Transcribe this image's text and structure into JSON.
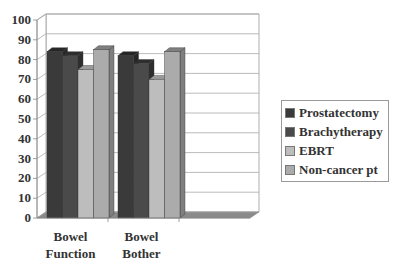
{
  "chart_data": {
    "type": "bar",
    "style": "3d-clustered-column",
    "title": "",
    "xlabel": "",
    "ylabel": "",
    "ylim": [
      0,
      100
    ],
    "yticks": [
      0,
      10,
      20,
      30,
      40,
      50,
      60,
      70,
      80,
      90,
      100
    ],
    "grid": true,
    "legend_position": "right",
    "categories": [
      "Bowel Function",
      "Bowel Bother",
      ""
    ],
    "series": [
      {
        "name": "Prostatectomy",
        "color": "#3a3a3a",
        "side": "#262626",
        "values": [
          84,
          82,
          null
        ]
      },
      {
        "name": "Brachytherapy",
        "color": "#4a4a4a",
        "side": "#2e2e2e",
        "values": [
          82,
          78,
          null
        ]
      },
      {
        "name": "EBRT",
        "color": "#bdbdbd",
        "side": "#9a9a9a",
        "values": [
          75,
          70,
          null
        ]
      },
      {
        "name": "Non-cancer pt",
        "color": "#ababab",
        "side": "#7f7f7f",
        "values": [
          85,
          84,
          null
        ]
      }
    ]
  },
  "axis": {
    "category_labels": [
      [
        "Bowel",
        "Function"
      ],
      [
        "Bowel",
        "Bother"
      ]
    ]
  },
  "legend": {
    "items": [
      "Prostatectomy",
      "Brachytherapy",
      "EBRT",
      "Non-cancer pt"
    ]
  }
}
